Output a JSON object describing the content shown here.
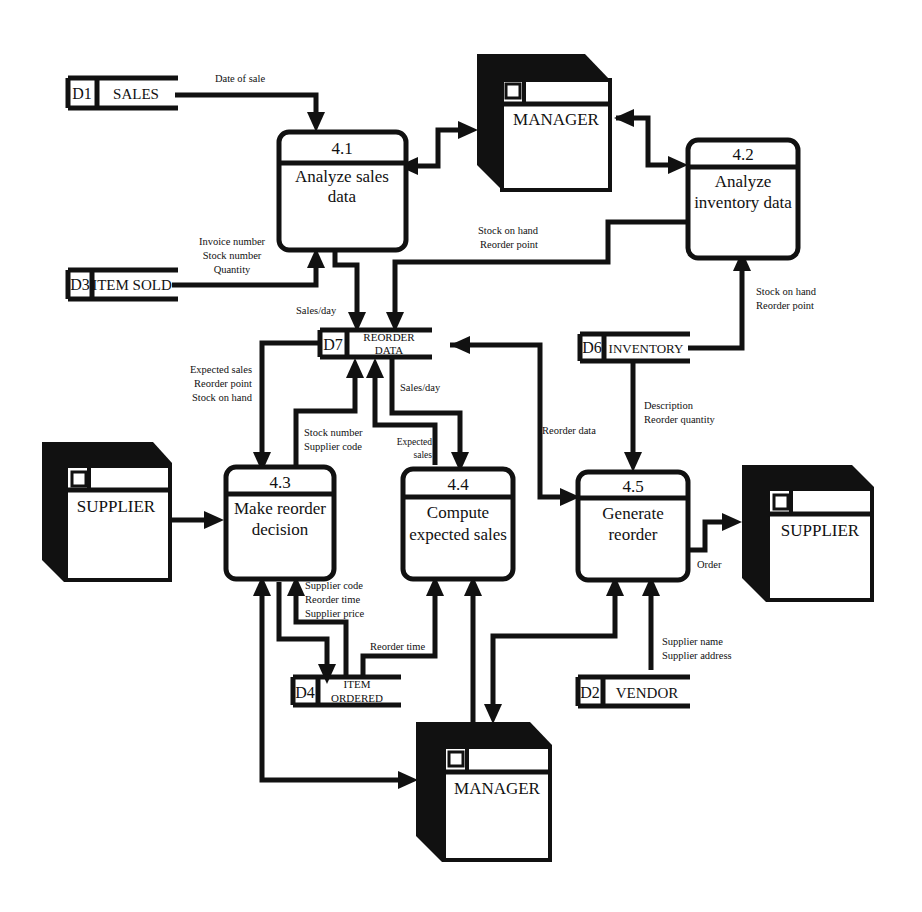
{
  "diagram": {
    "type": "data-flow-diagram",
    "processes": [
      {
        "id": "4.1",
        "name_lines": [
          "Analyze sales",
          "data"
        ]
      },
      {
        "id": "4.2",
        "name_lines": [
          "Analyze",
          "inventory data"
        ]
      },
      {
        "id": "4.3",
        "name_lines": [
          "Make reorder",
          "decision"
        ]
      },
      {
        "id": "4.4",
        "name_lines": [
          "Compute",
          "expected sales"
        ]
      },
      {
        "id": "4.5",
        "name_lines": [
          "Generate",
          "reorder"
        ]
      }
    ],
    "entities": [
      {
        "key": "manager_top",
        "name": "MANAGER"
      },
      {
        "key": "supplier_left",
        "name": "SUPPLIER"
      },
      {
        "key": "supplier_right",
        "name": "SUPPLIER"
      },
      {
        "key": "manager_bottom",
        "name": "MANAGER"
      }
    ],
    "stores": [
      {
        "id": "D1",
        "name_lines": [
          "SALES"
        ]
      },
      {
        "id": "D3",
        "name_lines": [
          "ITEM SOLD"
        ]
      },
      {
        "id": "D7",
        "name_lines": [
          "REORDER",
          "DATA"
        ]
      },
      {
        "id": "D6",
        "name_lines": [
          "INVENTORY"
        ]
      },
      {
        "id": "D4",
        "name_lines": [
          "ITEM",
          "ORDERED"
        ]
      },
      {
        "id": "D2",
        "name_lines": [
          "VENDOR"
        ]
      }
    ],
    "flows": {
      "date_of_sale": [
        "Date of sale"
      ],
      "item_sold_to_41": [
        "Invoice number",
        "Stock number",
        "Quantity"
      ],
      "sales_day_41_to_d7": [
        "Sales/day"
      ],
      "inv_42_to_d7": [
        "Stock on hand",
        "Reorder point"
      ],
      "d6_to_42": [
        "Stock on hand",
        "Reorder point"
      ],
      "d7_to_43": [
        "Expected sales",
        "Reorder point",
        "Stock on hand"
      ],
      "43_to_d7": [
        "Stock number",
        "Supplier code"
      ],
      "44_to_d7": [
        "Expected",
        "sales"
      ],
      "d7_to_44": [
        "Sales/day"
      ],
      "d7_to_45": [
        "Reorder data"
      ],
      "d6_to_45": [
        "Description",
        "Reorder quantity"
      ],
      "45_to_supplier": [
        "Order"
      ],
      "d4_to_43": [
        "Supplier code",
        "Reorder time",
        "Supplier price"
      ],
      "d4_to_44": [
        "Reorder time"
      ],
      "d2_to_45": [
        "Supplier name",
        "Supplier address"
      ]
    }
  }
}
